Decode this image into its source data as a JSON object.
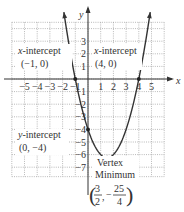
{
  "chart_data": {
    "type": "line",
    "title": "",
    "function": "y = x^2 - 3x - 4",
    "xlabel": "x",
    "ylabel": "y",
    "xlim": [
      -6,
      6
    ],
    "ylim": [
      -7.75,
      4.5
    ],
    "grid": true,
    "x_ticks": [
      -5,
      -4,
      -3,
      -2,
      -1,
      1,
      2,
      3,
      4,
      5
    ],
    "y_ticks": [
      3,
      2,
      1,
      -1,
      -2,
      -3,
      -4,
      -5,
      -6,
      -7
    ],
    "x_tick_labels": [
      "−5",
      "−4",
      "−3",
      "−2",
      "−1",
      "1",
      "2",
      "3",
      "4",
      "5"
    ],
    "y_tick_labels": [
      "3",
      "2",
      "1",
      "−1",
      "−2",
      "−3",
      "−4",
      "−5",
      "−6",
      "−7"
    ],
    "series": [
      {
        "name": "parabola",
        "x_range": [
          -1.9,
          4.9
        ],
        "color": "#333333"
      }
    ],
    "points": [
      {
        "name": "x-intercept-left",
        "x": -1,
        "y": 0
      },
      {
        "name": "x-intercept-right",
        "x": 4,
        "y": 0
      },
      {
        "name": "y-intercept",
        "x": 0,
        "y": -4
      },
      {
        "name": "vertex",
        "x": 1.5,
        "y": -6.25
      }
    ],
    "annotations": [
      {
        "id": "xint_left",
        "lines": [
          "x-intercept",
          "(−1, 0)"
        ]
      },
      {
        "id": "xint_right",
        "lines": [
          "x-intercept",
          "(4, 0)"
        ]
      },
      {
        "id": "yint",
        "lines": [
          "y-intercept",
          "(0, −4)"
        ]
      },
      {
        "id": "vertex",
        "lines": [
          "Vertex",
          "Minimum"
        ],
        "coord": {
          "x_num": "3",
          "x_den": "2",
          "y_sign": "−",
          "y_num": "25",
          "y_den": "4"
        }
      }
    ]
  },
  "labels": {
    "x_axis": "x",
    "y_axis": "y",
    "xint_left_title": "x-intercept",
    "xint_left_title_var": "x",
    "xint_left_title_rest": "-intercept",
    "xint_left_coord": "(−1, 0)",
    "xint_right_title_var": "x",
    "xint_right_title_rest": "-intercept",
    "xint_right_coord": "(4, 0)",
    "yint_title_var": "y",
    "yint_title_rest": "-intercept",
    "yint_coord": "(0, −4)",
    "vertex_line1": "Vertex",
    "vertex_line2": "Minimum",
    "vertex_x_num": "3",
    "vertex_x_den": "2",
    "vertex_comma": ",",
    "vertex_y_sign": "−",
    "vertex_y_num": "25",
    "vertex_y_den": "4"
  }
}
